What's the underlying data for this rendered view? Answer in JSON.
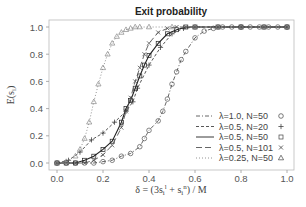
{
  "chart_data": {
    "type": "line",
    "title": "Exit probability",
    "xlabel": "δ = (3s_i^l + s_i^n) / M",
    "ylabel": "E(s_i)",
    "xlim": [
      0,
      1
    ],
    "ylim": [
      0,
      1
    ],
    "xticks": [
      "0.0",
      "0.2",
      "0.4",
      "0.6",
      "0.8",
      "1.0"
    ],
    "yticks": [
      "0.0",
      "0.2",
      "0.4",
      "0.6",
      "0.8",
      "1.0"
    ],
    "grid": false,
    "legend_position": "lower right",
    "series": [
      {
        "name": "λ=1.0, N=50",
        "marker": "circle",
        "dash": "dashdot",
        "x": [
          0,
          0.04,
          0.08,
          0.12,
          0.16,
          0.2,
          0.24,
          0.28,
          0.32,
          0.36,
          0.38,
          0.4,
          0.44,
          0.46,
          0.48,
          0.5,
          0.52,
          0.54,
          0.56,
          0.6,
          0.64,
          0.68,
          0.72,
          0.76,
          0.8,
          0.84,
          0.88,
          0.92,
          0.96,
          1.0
        ],
        "y": [
          0,
          0,
          0,
          0,
          0,
          0.01,
          0.02,
          0.05,
          0.07,
          0.12,
          0.18,
          0.24,
          0.31,
          0.38,
          0.47,
          0.58,
          0.67,
          0.76,
          0.82,
          0.92,
          0.97,
          0.99,
          1,
          1,
          1,
          1,
          1,
          1,
          1,
          1
        ]
      },
      {
        "name": "λ=0.5, N=20",
        "marker": "plus",
        "dash": "dash",
        "x": [
          0,
          0.05,
          0.1,
          0.15,
          0.2,
          0.25,
          0.3,
          0.33,
          0.35,
          0.4,
          0.45,
          0.5,
          0.55,
          0.6,
          0.7,
          0.8,
          0.9,
          1.0
        ],
        "y": [
          0,
          0.02,
          0.08,
          0.17,
          0.22,
          0.3,
          0.38,
          0.45,
          0.55,
          0.72,
          0.85,
          0.95,
          0.99,
          1,
          1,
          1,
          1,
          1
        ]
      },
      {
        "name": "λ=0.5, N=50",
        "marker": "square",
        "dash": "solid",
        "x": [
          0,
          0.04,
          0.08,
          0.12,
          0.16,
          0.2,
          0.24,
          0.28,
          0.3,
          0.32,
          0.34,
          0.36,
          0.38,
          0.4,
          0.44,
          0.48,
          0.52,
          0.56,
          0.6,
          0.7,
          0.8,
          0.9,
          1.0
        ],
        "y": [
          0,
          0,
          0,
          0.02,
          0.05,
          0.1,
          0.16,
          0.3,
          0.4,
          0.46,
          0.55,
          0.64,
          0.72,
          0.79,
          0.88,
          0.95,
          0.98,
          1,
          1,
          1,
          1,
          1,
          1
        ]
      },
      {
        "name": "λ=0.5, N=101",
        "marker": "cross",
        "dash": "longdash",
        "x": [
          0,
          0.04,
          0.08,
          0.12,
          0.16,
          0.2,
          0.24,
          0.28,
          0.3,
          0.32,
          0.34,
          0.36,
          0.38,
          0.4,
          0.44,
          0.48,
          0.52,
          0.56,
          0.6,
          0.7,
          0.8,
          0.9,
          1.0
        ],
        "y": [
          0,
          0,
          0,
          0,
          0.02,
          0.06,
          0.13,
          0.26,
          0.38,
          0.48,
          0.6,
          0.7,
          0.8,
          0.88,
          0.96,
          0.99,
          1,
          1,
          1,
          1,
          1,
          1,
          1
        ]
      },
      {
        "name": "λ=0.25, N=50",
        "marker": "triangle",
        "dash": "dotted",
        "x": [
          0,
          0.04,
          0.08,
          0.1,
          0.12,
          0.14,
          0.16,
          0.18,
          0.2,
          0.22,
          0.24,
          0.26,
          0.28,
          0.3,
          0.32,
          0.34,
          0.36,
          0.4,
          0.5,
          0.6,
          0.7,
          0.8,
          0.9,
          1.0
        ],
        "y": [
          0,
          0.01,
          0.05,
          0.1,
          0.18,
          0.3,
          0.45,
          0.58,
          0.7,
          0.8,
          0.88,
          0.93,
          0.96,
          0.98,
          0.99,
          1,
          1,
          1,
          1,
          1,
          1,
          1,
          1,
          1
        ]
      }
    ]
  },
  "legend": [
    {
      "label": "λ=1.0, N=50",
      "symbol": "○"
    },
    {
      "label": "λ=0.5, N=20",
      "symbol": "+"
    },
    {
      "label": "λ=0.5, N=50",
      "symbol": "□"
    },
    {
      "label": "λ=0.5, N=101",
      "symbol": "×"
    },
    {
      "label": "λ=0.25, N=50",
      "symbol": "△"
    }
  ]
}
